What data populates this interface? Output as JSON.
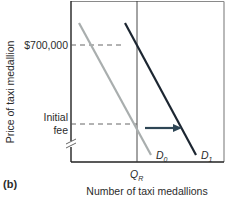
{
  "panel_label": "(b)",
  "axes": {
    "y_label": "Price of taxi medallion",
    "x_label": "Number of taxi medallions",
    "y_ticks": [
      {
        "label": "$700,000",
        "y": 45
      },
      {
        "label_line1": "Initial",
        "label_line2": "fee",
        "y": 124
      }
    ],
    "x_ticks": [
      {
        "label": "Q",
        "subscript": "R",
        "x": 137
      }
    ],
    "axis_break": true
  },
  "curves": {
    "d0": {
      "label": "D",
      "subscript": "0",
      "color": "#a9aeae",
      "from": [
        79,
        23
      ],
      "to": [
        151,
        155
      ]
    },
    "d1": {
      "label": "D",
      "subscript": "1",
      "color": "#1c2631",
      "from": [
        125,
        23
      ],
      "to": [
        196,
        155
      ]
    }
  },
  "shift_arrow": {
    "from": [
      145,
      128
    ],
    "to": [
      181,
      128
    ],
    "color": "#2e4655",
    "direction": "right"
  },
  "colors": {
    "axis": "#222222",
    "frame": "#8a8a8a",
    "dashes": "#555555"
  }
}
